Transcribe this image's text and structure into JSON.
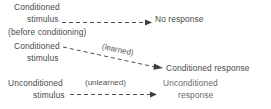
{
  "diagram": {
    "rows": [
      {
        "id": "row-before-conditioning",
        "stimulus_line1": "Conditioned",
        "stimulus_line2": "stimulus",
        "stimulus_line3": "(before conditioning)",
        "annotation": "",
        "response_line1": "No response",
        "response_line2": "",
        "arrow_style": "dashed-horizontal"
      },
      {
        "id": "row-learned",
        "stimulus_line1": "Conditioned",
        "stimulus_line2": "stimulus",
        "stimulus_line3": "",
        "annotation": "(learned)",
        "response_line1": "Conditioned response",
        "response_line2": "",
        "arrow_style": "dashed-diagonal"
      },
      {
        "id": "row-unlearned",
        "stimulus_line1": "Unconditioned",
        "stimulus_line2": "stimulus",
        "stimulus_line3": "",
        "annotation": "(unlearned)",
        "response_line1": "Unconditioned",
        "response_line2": "response",
        "arrow_style": "dashed-horizontal"
      }
    ],
    "colors": {
      "text": "#4a4a4a",
      "line": "#4d4d4d",
      "background": "#ffffff"
    }
  }
}
